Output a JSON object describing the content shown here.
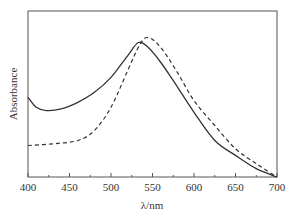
{
  "chart_data": {
    "type": "line",
    "title": "",
    "xlabel": "λ/nm",
    "ylabel": "Absorbance",
    "xlim": [
      400,
      700
    ],
    "ylim": [
      0,
      1
    ],
    "x_ticks": [
      400,
      450,
      500,
      550,
      600,
      650,
      700
    ],
    "x_tick_labels": [
      "400",
      "450",
      "500",
      "550",
      "600",
      "650",
      "700"
    ],
    "y_ticks": [],
    "grid": false,
    "legend": null,
    "series": [
      {
        "name": "solid",
        "style": "solid",
        "color": "#333333",
        "x": [
          400,
          410,
          422,
          440,
          460,
          480,
          500,
          520,
          533,
          545,
          560,
          575,
          600,
          625,
          650,
          675,
          700
        ],
        "values": [
          0.48,
          0.42,
          0.4,
          0.41,
          0.45,
          0.51,
          0.6,
          0.73,
          0.81,
          0.78,
          0.69,
          0.58,
          0.39,
          0.22,
          0.13,
          0.05,
          0.0
        ]
      },
      {
        "name": "dashed",
        "style": "dashed",
        "color": "#333333",
        "x": [
          400,
          430,
          460,
          480,
          500,
          520,
          535,
          545,
          560,
          580,
          600,
          625,
          650,
          675,
          700
        ],
        "values": [
          0.19,
          0.2,
          0.22,
          0.28,
          0.42,
          0.64,
          0.8,
          0.84,
          0.78,
          0.63,
          0.46,
          0.31,
          0.17,
          0.08,
          0.0
        ]
      }
    ]
  },
  "plot_area": {
    "left": 28,
    "top": 11,
    "right": 277,
    "bottom": 177
  }
}
